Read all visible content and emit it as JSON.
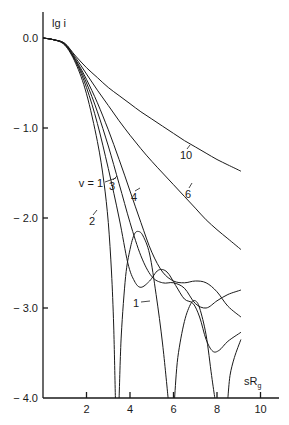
{
  "chart_data": {
    "type": "line",
    "title": "",
    "xlabel": "sR_g",
    "ylabel": "lg i",
    "xlim": [
      0,
      10.8
    ],
    "ylim": [
      -4.0,
      0.35
    ],
    "grid": false,
    "legend": "inline labels on curves",
    "x_ticks": [
      2,
      4,
      6,
      8,
      10
    ],
    "x_tick_labels": [
      "2",
      "4",
      "6",
      "8",
      "10"
    ],
    "y_ticks": [
      0.0,
      -1.0,
      -2.0,
      -3.0,
      -4.0
    ],
    "y_tick_labels": [
      "0.0",
      "− 1.0",
      "− 2.0",
      "− 3.0",
      "− 4.0"
    ],
    "series": [
      {
        "name": "v = 1",
        "label": "v = 1",
        "segments": [
          [
            [
              0,
              0
            ],
            [
              0.5,
              -0.02
            ],
            [
              1,
              -0.08
            ],
            [
              1.5,
              -0.28
            ],
            [
              2,
              -0.62
            ],
            [
              2.5,
              -1.15
            ],
            [
              2.8,
              -1.6
            ],
            [
              3.0,
              -2.05
            ],
            [
              3.15,
              -2.6
            ],
            [
              3.25,
              -3.2
            ],
            [
              3.33,
              -4.0
            ]
          ],
          [
            [
              3.5,
              -4.0
            ],
            [
              3.6,
              -3.3
            ],
            [
              3.8,
              -2.65
            ],
            [
              4.0,
              -2.35
            ],
            [
              4.2,
              -2.18
            ],
            [
              4.4,
              -2.15
            ],
            [
              4.6,
              -2.2
            ],
            [
              4.9,
              -2.4
            ],
            [
              5.2,
              -2.85
            ],
            [
              5.5,
              -3.4
            ],
            [
              5.75,
              -4.0
            ]
          ],
          [
            [
              6.05,
              -4.0
            ],
            [
              6.2,
              -3.55
            ],
            [
              6.5,
              -3.15
            ],
            [
              6.8,
              -2.95
            ],
            [
              7.0,
              -2.92
            ],
            [
              7.2,
              -3.0
            ],
            [
              7.5,
              -3.3
            ],
            [
              7.75,
              -3.75
            ],
            [
              7.9,
              -4.0
            ]
          ],
          [
            [
              8.5,
              -4.0
            ],
            [
              8.6,
              -3.75
            ],
            [
              8.8,
              -3.55
            ],
            [
              9.1,
              -3.35
            ]
          ]
        ]
      },
      {
        "name": "2",
        "label": "2",
        "points": [
          [
            0,
            0
          ],
          [
            0.5,
            -0.02
          ],
          [
            1,
            -0.07
          ],
          [
            1.5,
            -0.26
          ],
          [
            2,
            -0.55
          ],
          [
            2.5,
            -0.95
          ],
          [
            3,
            -1.45
          ],
          [
            3.5,
            -2.0
          ],
          [
            3.9,
            -2.5
          ],
          [
            4.2,
            -2.7
          ],
          [
            4.5,
            -2.77
          ],
          [
            4.9,
            -2.7
          ],
          [
            5.3,
            -2.58
          ],
          [
            5.7,
            -2.6
          ],
          [
            6.1,
            -2.75
          ],
          [
            6.5,
            -2.9
          ],
          [
            6.9,
            -2.95
          ],
          [
            7.2,
            -3.1
          ],
          [
            7.5,
            -3.35
          ],
          [
            7.8,
            -3.48
          ],
          [
            8.1,
            -3.47
          ],
          [
            8.5,
            -3.37
          ],
          [
            9.1,
            -3.27
          ]
        ]
      },
      {
        "name": "3",
        "label": "3",
        "points": [
          [
            0,
            0
          ],
          [
            0.5,
            -0.02
          ],
          [
            1,
            -0.07
          ],
          [
            1.5,
            -0.25
          ],
          [
            2,
            -0.5
          ],
          [
            2.5,
            -0.82
          ],
          [
            3,
            -1.2
          ],
          [
            3.5,
            -1.62
          ],
          [
            4,
            -2.05
          ],
          [
            4.5,
            -2.42
          ],
          [
            5,
            -2.65
          ],
          [
            5.5,
            -2.72
          ],
          [
            6,
            -2.72
          ],
          [
            6.5,
            -2.78
          ],
          [
            7,
            -2.95
          ],
          [
            7.5,
            -3.0
          ],
          [
            8,
            -2.92
          ],
          [
            8.5,
            -2.85
          ],
          [
            9.1,
            -2.8
          ]
        ]
      },
      {
        "name": "4",
        "label": "4",
        "points": [
          [
            0,
            0
          ],
          [
            0.5,
            -0.02
          ],
          [
            1,
            -0.07
          ],
          [
            1.5,
            -0.24
          ],
          [
            2,
            -0.46
          ],
          [
            2.5,
            -0.72
          ],
          [
            3,
            -1.02
          ],
          [
            3.5,
            -1.35
          ],
          [
            4,
            -1.7
          ],
          [
            4.5,
            -2.05
          ],
          [
            5,
            -2.38
          ],
          [
            5.5,
            -2.6
          ],
          [
            6,
            -2.7
          ],
          [
            6.5,
            -2.72
          ],
          [
            7,
            -2.7
          ],
          [
            7.5,
            -2.72
          ],
          [
            8,
            -2.82
          ],
          [
            8.5,
            -2.98
          ],
          [
            9.1,
            -3.1
          ]
        ]
      },
      {
        "name": "6",
        "label": "6",
        "points": [
          [
            0,
            0
          ],
          [
            0.5,
            -0.02
          ],
          [
            1,
            -0.06
          ],
          [
            1.5,
            -0.22
          ],
          [
            2,
            -0.4
          ],
          [
            2.5,
            -0.58
          ],
          [
            3,
            -0.75
          ],
          [
            3.5,
            -0.92
          ],
          [
            4,
            -1.08
          ],
          [
            4.5,
            -1.23
          ],
          [
            5,
            -1.37
          ],
          [
            5.5,
            -1.5
          ],
          [
            6,
            -1.63
          ],
          [
            6.5,
            -1.76
          ],
          [
            7,
            -1.89
          ],
          [
            7.5,
            -2.02
          ],
          [
            8,
            -2.13
          ],
          [
            8.5,
            -2.23
          ],
          [
            9.1,
            -2.35
          ]
        ]
      },
      {
        "name": "10",
        "label": "10",
        "points": [
          [
            0,
            0
          ],
          [
            0.5,
            -0.02
          ],
          [
            1,
            -0.06
          ],
          [
            1.5,
            -0.2
          ],
          [
            2,
            -0.33
          ],
          [
            2.5,
            -0.44
          ],
          [
            3,
            -0.55
          ],
          [
            3.5,
            -0.64
          ],
          [
            4,
            -0.73
          ],
          [
            4.5,
            -0.82
          ],
          [
            5,
            -0.9
          ],
          [
            5.5,
            -0.98
          ],
          [
            6,
            -1.06
          ],
          [
            6.5,
            -1.14
          ],
          [
            7,
            -1.21
          ],
          [
            7.5,
            -1.28
          ],
          [
            8,
            -1.35
          ],
          [
            8.5,
            -1.41
          ],
          [
            9.1,
            -1.48
          ]
        ]
      }
    ],
    "annotations": [
      {
        "text": "v = 1",
        "x": 2.6,
        "y": -1.85
      },
      {
        "text": "2",
        "x": 2.4,
        "y": -2.05
      },
      {
        "text": "3",
        "x": 3.1,
        "y": -1.65
      },
      {
        "text": "4",
        "x": 4.2,
        "y": -1.85
      },
      {
        "text": "6",
        "x": 5.8,
        "y": -1.75
      },
      {
        "text": "10",
        "x": 6.5,
        "y": -1.27
      },
      {
        "text": "1",
        "x": 4.5,
        "y": -2.95
      }
    ]
  },
  "axes": {
    "y_label": "lg i",
    "x_label_main": "sR",
    "x_label_sub": "g"
  }
}
